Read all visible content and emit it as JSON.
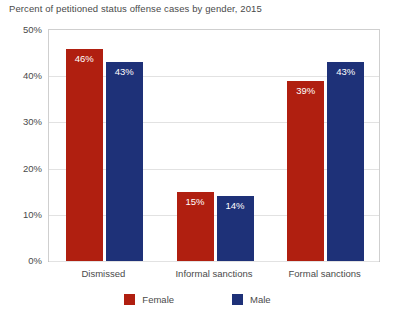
{
  "chart_data": {
    "type": "bar",
    "title": "Percent of petitioned status offense cases by gender, 2015",
    "xlabel": "",
    "ylabel": "",
    "ylim": [
      0,
      50
    ],
    "ytick_labels": [
      "50%",
      "40%",
      "30%",
      "20%",
      "10%",
      "0%"
    ],
    "ytick_values": [
      50,
      40,
      30,
      20,
      10,
      0
    ],
    "grid": true,
    "legend_position": "bottom",
    "categories": [
      "Dismissed",
      "Informal sanctions",
      "Formal sanctions"
    ],
    "series": [
      {
        "name": "Female",
        "color": "#b01f10",
        "values": [
          46,
          15,
          39
        ],
        "labels": [
          "46%",
          "15%",
          "39%"
        ]
      },
      {
        "name": "Male",
        "color": "#1e3178",
        "values": [
          43,
          14,
          43
        ],
        "labels": [
          "43%",
          "14%",
          "43%"
        ]
      }
    ]
  },
  "legend": {
    "items": [
      {
        "label": "Female",
        "color": "#b01f10"
      },
      {
        "label": "Male",
        "color": "#1e3178"
      }
    ]
  },
  "colors": {
    "female": "#b01f10",
    "male": "#1e3178",
    "text": "#4a4a4a",
    "gridline": "#e2e2e2",
    "axis": "#cfcfcf",
    "background": "#ffffff"
  }
}
